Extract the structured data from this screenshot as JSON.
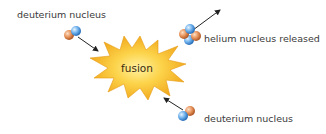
{
  "diagram": {
    "center": {
      "label": "fusion",
      "shape": "starburst",
      "fill_outer": "#f2a91c",
      "fill_inner": "#fde36a"
    },
    "labels": {
      "top_left": "deuterium nucleus",
      "top_right": "helium nucleus released",
      "bottom_right": "deuterium nucleus"
    },
    "particles": {
      "proton_color": "#e8935a",
      "neutron_color": "#5aa3e6"
    },
    "arrows": [
      {
        "from": "deuterium nucleus (top-left)",
        "to": "fusion"
      },
      {
        "from": "fusion",
        "to": "helium nucleus released"
      },
      {
        "from": "deuterium nucleus (bottom-right)",
        "to": "fusion"
      }
    ]
  }
}
